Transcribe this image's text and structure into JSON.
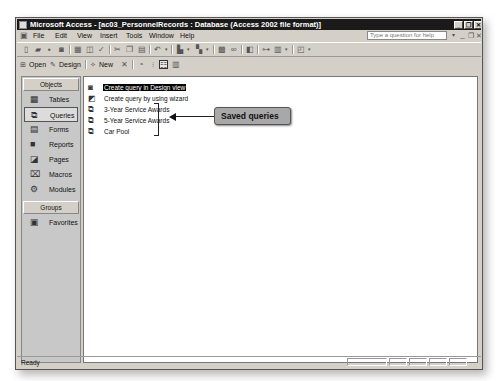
{
  "window": {
    "title": "Microsoft Access - [ac03_PersonnelRecords : Database (Access 2002 file format)]",
    "controls": {
      "minimize": "_",
      "restore": "❐",
      "close": "✕"
    }
  },
  "menubar": {
    "items": [
      {
        "label": "File"
      },
      {
        "label": "Edit"
      },
      {
        "label": "View"
      },
      {
        "label": "Insert"
      },
      {
        "label": "Tools"
      },
      {
        "label": "Window"
      },
      {
        "label": "Help"
      }
    ],
    "help_placeholder": "Type a question for help",
    "doc_controls": {
      "minimize": "_",
      "restore": "❐",
      "close": "✕"
    }
  },
  "db_toolbar": {
    "open": "Open",
    "design": "Design",
    "new": "New"
  },
  "objects_pane": {
    "objects_header": "Objects",
    "items": [
      {
        "label": "Tables",
        "icon": "table-icon"
      },
      {
        "label": "Queries",
        "icon": "query-icon",
        "selected": true
      },
      {
        "label": "Forms",
        "icon": "form-icon"
      },
      {
        "label": "Reports",
        "icon": "report-icon"
      },
      {
        "label": "Pages",
        "icon": "page-icon"
      },
      {
        "label": "Macros",
        "icon": "macro-icon"
      },
      {
        "label": "Modules",
        "icon": "module-icon"
      }
    ],
    "groups_header": "Groups",
    "groups": [
      {
        "label": "Favorites",
        "icon": "favorites-icon"
      }
    ]
  },
  "list": {
    "items": [
      {
        "label": "Create query in Design view",
        "icon": "design-view-icon",
        "highlighted": true
      },
      {
        "label": "Create query by using wizard",
        "icon": "wizard-icon"
      },
      {
        "label": "3-Year Service Awards",
        "icon": "query-icon"
      },
      {
        "label": "5-Year Service Awards",
        "icon": "query-icon"
      },
      {
        "label": "Car Pool",
        "icon": "query-icon"
      }
    ]
  },
  "annotation": {
    "callout": "Saved queries"
  },
  "statusbar": {
    "text": "Ready"
  }
}
